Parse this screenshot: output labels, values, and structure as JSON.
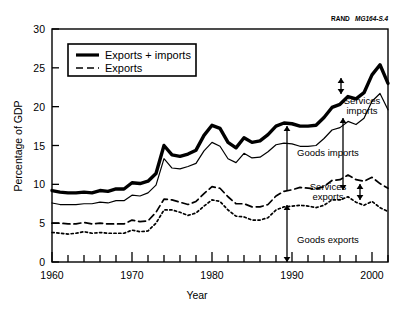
{
  "credit": {
    "brand": "RAND",
    "doc_id": "MG164-S.4"
  },
  "legend": {
    "position": "top-left-inside",
    "items": [
      {
        "label": "Exports + imports",
        "style": "thick-solid"
      },
      {
        "label": "Exports",
        "style": "dashed"
      }
    ]
  },
  "annotations": [
    {
      "id": "services-imports",
      "label_line1": "Services",
      "label_line2": "imports"
    },
    {
      "id": "goods-imports",
      "label_line1": "Goods imports",
      "label_line2": ""
    },
    {
      "id": "services-exports",
      "label_line1": "Services",
      "label_line2": "exports"
    },
    {
      "id": "goods-exports",
      "label_line1": "Goods exports",
      "label_line2": ""
    }
  ],
  "chart_data": {
    "type": "line",
    "title": "",
    "xlabel": "Year",
    "ylabel": "Percentage of GDP",
    "xlim": [
      1960,
      2002
    ],
    "ylim": [
      0,
      30
    ],
    "ytick_labels": [
      "0",
      "5",
      "10",
      "15",
      "20",
      "25",
      "30"
    ],
    "yticks": [
      0,
      5,
      10,
      15,
      20,
      25,
      30
    ],
    "xtick_labels": [
      "1960",
      "1970",
      "1980",
      "1990",
      "2000"
    ],
    "xticks_major": [
      1960,
      1970,
      1980,
      1990,
      2000
    ],
    "xticks_minor_step": 2,
    "grid": false,
    "x": [
      1960,
      1961,
      1962,
      1963,
      1964,
      1965,
      1966,
      1967,
      1968,
      1969,
      1970,
      1971,
      1972,
      1973,
      1974,
      1975,
      1976,
      1977,
      1978,
      1979,
      1980,
      1981,
      1982,
      1983,
      1984,
      1985,
      1986,
      1987,
      1988,
      1989,
      1990,
      1991,
      1992,
      1993,
      1994,
      1995,
      1996,
      1997,
      1998,
      1999,
      2000,
      2001,
      2002
    ],
    "series": [
      {
        "name": "Exports + imports (goods and services)",
        "style": "thick-solid",
        "values": [
          9.2,
          9.0,
          8.9,
          8.9,
          9.0,
          8.9,
          9.2,
          9.1,
          9.4,
          9.4,
          10.2,
          10.1,
          10.4,
          11.4,
          15.0,
          13.8,
          13.6,
          13.9,
          14.4,
          16.3,
          17.6,
          17.2,
          15.4,
          14.7,
          16.0,
          15.4,
          15.6,
          16.4,
          17.5,
          17.9,
          17.8,
          17.5,
          17.5,
          17.6,
          18.6,
          19.9,
          20.3,
          21.3,
          21.0,
          21.8,
          24.1,
          25.4,
          23.0
        ]
      },
      {
        "name": "Exports + imports (goods only)",
        "style": "thin-solid",
        "values": [
          7.6,
          7.4,
          7.4,
          7.4,
          7.5,
          7.5,
          7.7,
          7.6,
          7.9,
          7.9,
          8.6,
          8.5,
          8.9,
          9.9,
          13.3,
          12.1,
          12.0,
          12.3,
          12.7,
          14.3,
          15.4,
          14.9,
          13.3,
          12.8,
          14.0,
          13.4,
          13.5,
          14.2,
          15.1,
          15.3,
          15.2,
          14.9,
          14.9,
          15.0,
          15.9,
          17.0,
          17.3,
          18.1,
          17.7,
          18.5,
          20.7,
          21.7,
          19.6
        ]
      },
      {
        "name": "Exports (goods and services)",
        "style": "dashed",
        "values": [
          5.0,
          5.0,
          4.9,
          4.9,
          5.1,
          4.9,
          5.0,
          4.9,
          4.9,
          4.9,
          5.4,
          5.2,
          5.3,
          6.4,
          8.1,
          8.0,
          7.7,
          7.4,
          7.8,
          8.8,
          9.7,
          9.5,
          8.4,
          7.5,
          7.5,
          7.1,
          7.1,
          7.4,
          8.5,
          9.1,
          9.3,
          9.6,
          9.5,
          9.4,
          9.7,
          10.5,
          10.6,
          11.2,
          10.6,
          10.4,
          10.9,
          10.1,
          9.5
        ]
      },
      {
        "name": "Exports (goods only)",
        "style": "dotted",
        "values": [
          3.8,
          3.7,
          3.6,
          3.7,
          3.9,
          3.7,
          3.8,
          3.7,
          3.7,
          3.7,
          4.1,
          3.9,
          4.0,
          5.0,
          6.7,
          6.7,
          6.4,
          6.0,
          6.3,
          7.2,
          8.0,
          7.8,
          6.7,
          5.9,
          5.8,
          5.4,
          5.4,
          5.7,
          6.7,
          7.1,
          7.2,
          7.3,
          7.2,
          7.0,
          7.3,
          8.0,
          8.0,
          8.4,
          7.7,
          7.3,
          7.8,
          7.0,
          6.5
        ]
      }
    ]
  }
}
